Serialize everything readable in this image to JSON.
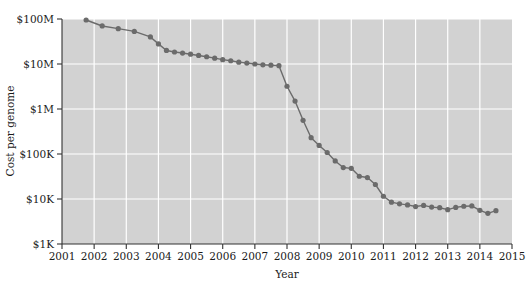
{
  "figure": {
    "background_color": "#ffffff",
    "plot_background_color": "#d2d2d2",
    "gridline_color": "#ffffff",
    "axis_color": "#333333",
    "series_color": "#6b6b6b"
  },
  "axes": {
    "y_title": "Cost per genome",
    "x_title": "Year",
    "y_ticks": [
      "$1K",
      "$10K",
      "$100K",
      "$1M",
      "$10M",
      "$100M"
    ],
    "x_ticks": [
      "2001",
      "2002",
      "2003",
      "2004",
      "2005",
      "2006",
      "2007",
      "2008",
      "2009",
      "2010",
      "2011",
      "2012",
      "2013",
      "2014",
      "2015"
    ]
  },
  "chart_data": {
    "type": "line",
    "title": "",
    "subtitle": "",
    "xlabel": "Year",
    "ylabel": "Cost per genome",
    "x_scale": "linear",
    "y_scale": "log",
    "xlim": [
      2001,
      2015
    ],
    "ylim": [
      1000,
      100000000
    ],
    "grid": true,
    "legend": "none",
    "marker": "filled-circle",
    "y_tick_labels": [
      "$1K",
      "$10K",
      "$100K",
      "$1M",
      "$10M",
      "$100M"
    ],
    "y_tick_values": [
      1000,
      10000,
      100000,
      1000000,
      10000000,
      100000000
    ],
    "x_tick_labels": [
      "2001",
      "2002",
      "2003",
      "2004",
      "2005",
      "2006",
      "2007",
      "2008",
      "2009",
      "2010",
      "2011",
      "2012",
      "2013",
      "2014",
      "2015"
    ],
    "x_tick_values": [
      2001,
      2002,
      2003,
      2004,
      2005,
      2006,
      2007,
      2008,
      2009,
      2010,
      2011,
      2012,
      2013,
      2014,
      2015
    ],
    "series": [
      {
        "name": "Cost per genome",
        "color": "#6b6b6b",
        "x": [
          2001.75,
          2002.25,
          2002.75,
          2003.25,
          2003.75,
          2004.0,
          2004.25,
          2004.5,
          2004.75,
          2005.0,
          2005.25,
          2005.5,
          2005.75,
          2006.0,
          2006.25,
          2006.5,
          2006.75,
          2007.0,
          2007.25,
          2007.5,
          2007.75,
          2008.0,
          2008.25,
          2008.5,
          2008.75,
          2009.0,
          2009.25,
          2009.5,
          2009.75,
          2010.0,
          2010.25,
          2010.5,
          2010.75,
          2011.0,
          2011.25,
          2011.5,
          2011.75,
          2012.0,
          2012.25,
          2012.5,
          2012.75,
          2013.0,
          2013.25,
          2013.5,
          2013.75,
          2014.0,
          2014.25,
          2014.5
        ],
        "y": [
          95000000,
          70000000,
          61000000,
          53000000,
          40000000,
          28000000,
          20000000,
          18500000,
          17500000,
          16500000,
          15500000,
          14500000,
          13500000,
          12500000,
          11800000,
          11000000,
          10500000,
          10000000,
          9600000,
          9400000,
          9200000,
          3200000,
          1500000,
          560000,
          230000,
          155000,
          108000,
          70000,
          50000,
          48000,
          32000,
          30000,
          21000,
          11500,
          8500,
          7800,
          7400,
          6800,
          7200,
          6600,
          6400,
          5800,
          6500,
          6900,
          7000,
          5600,
          4800,
          5500
        ]
      }
    ],
    "annotations": []
  }
}
